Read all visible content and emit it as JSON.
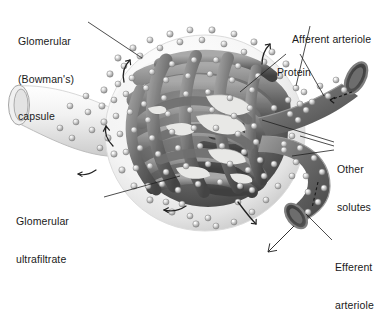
{
  "figure": {
    "style": "grayscale anatomical illustration",
    "background_color": "#ffffff",
    "text_color": "#1a1a1a"
  },
  "labels": {
    "bowmans_capsule": {
      "line1": "Glomerular",
      "line2": "(Bowman's)",
      "line3": "capsule",
      "x": 18,
      "y": 10
    },
    "afferent_arteriole": {
      "line1": "Afferent arteriole",
      "x": 292,
      "y": 8
    },
    "protein": {
      "line1": "Protein",
      "x": 277,
      "y": 41
    },
    "other_solutes": {
      "line1": "Other",
      "line2": "solutes",
      "x": 337,
      "y": 138
    },
    "efferent_arteriole": {
      "line1": "Efferent",
      "line2": "arteriole",
      "x": 335,
      "y": 236
    },
    "glomerular_ultrafiltrate": {
      "line1": "Glomerular",
      "line2": "ultrafiltrate",
      "x": 16,
      "y": 190
    }
  },
  "anatomy": {
    "capsule": {
      "name": "Bowman's capsule",
      "fill_light": "#fdfdfd",
      "fill_shadow": "#c9c9c9",
      "center_x": 205,
      "center_y": 133,
      "radius_x": 100,
      "radius_y": 98
    },
    "proximal_tubule": {
      "name": "tubule neck",
      "opening_x": 18,
      "opening_y": 102,
      "fill": "#f4f4f4"
    },
    "glomerulus": {
      "name": "glomerular capillary tuft",
      "fill_dark": "#4a4a4a",
      "fill_mid": "#7d7d7d",
      "fill_light": "#b4b4b4",
      "loop_count": 14
    },
    "afferent_vessel": {
      "name": "afferent arteriole",
      "mouth_x": 360,
      "mouth_y": 74,
      "flow_direction": "into glomerulus"
    },
    "efferent_vessel": {
      "name": "efferent arteriole",
      "mouth_x": 297,
      "mouth_y": 216,
      "flow_direction": "out of glomerulus"
    },
    "solute_spheres": {
      "name": "solute particles",
      "fill": "#d2d2d2",
      "highlight": "#ffffff",
      "edge": "#6e6e6e",
      "radius": 3.1,
      "count": 188
    }
  },
  "leader_lines": {
    "color": "#1f1f1f",
    "width": 0.8
  },
  "flow_arrows": {
    "color": "#222222",
    "count": 8,
    "note": "filtration arrows from capillaries into capsular space"
  }
}
